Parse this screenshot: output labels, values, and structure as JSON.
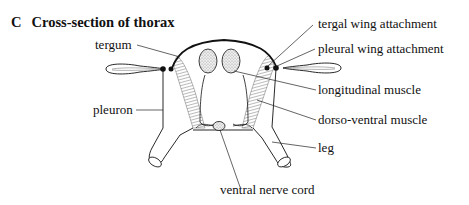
{
  "figure": {
    "panel_letter": "C",
    "title": "Cross-section of thorax"
  },
  "labels": {
    "tergum": "tergum",
    "tergal_wing_attachment": "tergal wing attachment",
    "pleural_wing_attachment": "pleural wing attachment",
    "longitudinal_muscle": "longitudinal muscle",
    "pleuron": "pleuron",
    "dorso_ventral_muscle": "dorso-ventral muscle",
    "leg": "leg",
    "ventral_nerve_cord": "ventral nerve cord"
  },
  "colors": {
    "ink": "#111111",
    "stipple": "#d9d9d9",
    "hatch": "#555555"
  }
}
